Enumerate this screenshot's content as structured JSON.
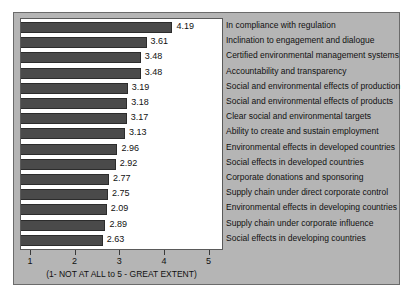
{
  "chart_data": {
    "type": "bar",
    "orientation": "horizontal",
    "title": "",
    "xlabel": "(1- NOT AT ALL to 5 - GREAT EXTENT)",
    "ylabel": "",
    "xlim": [
      0.8,
      5.3
    ],
    "xticks": [
      1,
      2,
      3,
      4,
      5
    ],
    "xtick_labels": [
      "1",
      "2",
      "3",
      "4",
      "5"
    ],
    "grid": false,
    "legend": "none",
    "bar_color": "#4a4a4a",
    "background_color": "#b5b5b5",
    "plot_background_color": "#ffffff",
    "categories": [
      "In compliance with regulation",
      "Inclination to engagement and dialogue",
      "Certified environmental management systems",
      "Accountability and transparency",
      "Social and environmental effects of production",
      "Social and environmental effects of products",
      "Clear social and environmental targets",
      "Ability to create and sustain employment",
      "Environmental effects in developed countries",
      "Social effects in developed countries",
      "Corporate donations and sponsoring",
      "Supply chain under direct corporate control",
      "Environmental effects in developing countries",
      "Supply chain under corporate influence",
      "Social effects in developing countries"
    ],
    "values": [
      4.19,
      3.61,
      3.48,
      3.48,
      3.19,
      3.18,
      3.17,
      3.13,
      2.96,
      2.92,
      2.77,
      2.75,
      2.09,
      2.89,
      2.63
    ],
    "value_labels": [
      "4.19",
      "3.61",
      "3.48",
      "3.48",
      "3.19",
      "3.18",
      "3.17",
      "3.13",
      "2.96",
      "2.92",
      "2.77",
      "2.75",
      "2.09",
      "2.89",
      "2.63"
    ],
    "bar_pixel_values": [
      4.19,
      3.61,
      3.48,
      3.48,
      3.19,
      3.18,
      3.17,
      3.13,
      2.96,
      2.92,
      2.77,
      2.75,
      2.72,
      2.69,
      2.63
    ]
  }
}
